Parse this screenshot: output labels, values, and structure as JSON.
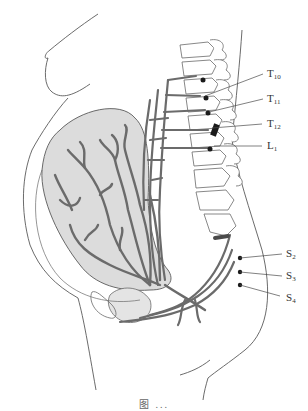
{
  "figure": {
    "type": "anatomical-illustration",
    "colors": {
      "outline": "#5a5a5a",
      "nerve": "#6b6b6b",
      "uterus_fill": "#dcdcdc",
      "nerve_ganglion": "#1a1a1a",
      "label_text": "#333333"
    }
  },
  "labels": {
    "t10": {
      "main": "T",
      "sub": "10"
    },
    "t11": {
      "main": "T",
      "sub": "11"
    },
    "t12": {
      "main": "T",
      "sub": "12"
    },
    "l1": {
      "main": "L",
      "sub": "1"
    },
    "s2": {
      "main": "S",
      "sub": "2"
    },
    "s3": {
      "main": "S",
      "sub": "3"
    },
    "s4": {
      "main": "S",
      "sub": "4"
    }
  },
  "caption": {
    "text": "图 ..."
  }
}
